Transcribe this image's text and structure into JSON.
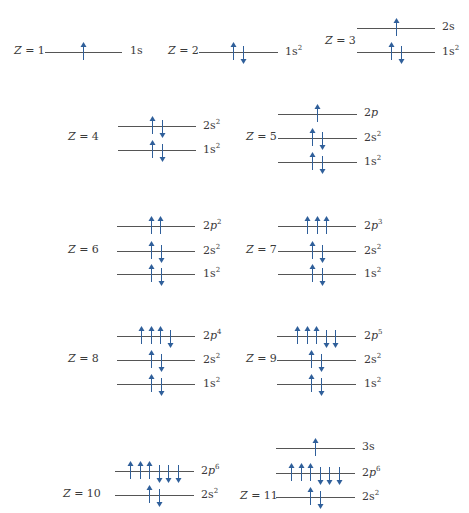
{
  "figure": {
    "colors": {
      "arrow": "#2f5f9a",
      "line": "#555555",
      "text": "#3a3a3a"
    },
    "atoms": [
      {
        "z_label": "Z = 1",
        "levels": [
          {
            "orbital": "1s",
            "num": "1",
            "sub": "s",
            "exp": "",
            "spins": [
              "up"
            ]
          }
        ]
      },
      {
        "z_label": "Z = 2",
        "levels": [
          {
            "orbital": "1s2",
            "num": "1",
            "sub": "s",
            "exp": "2",
            "spins": [
              "up",
              "down"
            ]
          }
        ]
      },
      {
        "z_label": "Z = 3",
        "levels": [
          {
            "orbital": "2s",
            "num": "2",
            "sub": "s",
            "exp": "",
            "spins": [
              "up"
            ]
          },
          {
            "orbital": "1s2",
            "num": "1",
            "sub": "s",
            "exp": "2",
            "spins": [
              "up",
              "down"
            ]
          }
        ]
      },
      {
        "z_label": "Z = 4",
        "levels": [
          {
            "orbital": "2s2",
            "num": "2",
            "sub": "s",
            "exp": "2",
            "spins": [
              "up",
              "down"
            ]
          },
          {
            "orbital": "1s2",
            "num": "1",
            "sub": "s",
            "exp": "2",
            "spins": [
              "up",
              "down"
            ]
          }
        ]
      },
      {
        "z_label": "Z = 5",
        "levels": [
          {
            "orbital": "2p",
            "num": "2",
            "sub": "p",
            "exp": "",
            "spins": [
              "up"
            ]
          },
          {
            "orbital": "2s2",
            "num": "2",
            "sub": "s",
            "exp": "2",
            "spins": [
              "up",
              "down"
            ]
          },
          {
            "orbital": "1s2",
            "num": "1",
            "sub": "s",
            "exp": "2",
            "spins": [
              "up",
              "down"
            ]
          }
        ]
      },
      {
        "z_label": "Z = 6",
        "levels": [
          {
            "orbital": "2p2",
            "num": "2",
            "sub": "p",
            "exp": "2",
            "spins": [
              "up",
              "up"
            ]
          },
          {
            "orbital": "2s2",
            "num": "2",
            "sub": "s",
            "exp": "2",
            "spins": [
              "up",
              "down"
            ]
          },
          {
            "orbital": "1s2",
            "num": "1",
            "sub": "s",
            "exp": "2",
            "spins": [
              "up",
              "down"
            ]
          }
        ]
      },
      {
        "z_label": "Z = 7",
        "levels": [
          {
            "orbital": "2p3",
            "num": "2",
            "sub": "p",
            "exp": "3",
            "spins": [
              "up",
              "up",
              "up"
            ]
          },
          {
            "orbital": "2s2",
            "num": "2",
            "sub": "s",
            "exp": "2",
            "spins": [
              "up",
              "down"
            ]
          },
          {
            "orbital": "1s2",
            "num": "1",
            "sub": "s",
            "exp": "2",
            "spins": [
              "up",
              "down"
            ]
          }
        ]
      },
      {
        "z_label": "Z = 8",
        "levels": [
          {
            "orbital": "2p4",
            "num": "2",
            "sub": "p",
            "exp": "4",
            "spins": [
              "up",
              "up",
              "up",
              "down"
            ]
          },
          {
            "orbital": "2s2",
            "num": "2",
            "sub": "s",
            "exp": "2",
            "spins": [
              "up",
              "down"
            ]
          },
          {
            "orbital": "1s2",
            "num": "1",
            "sub": "s",
            "exp": "2",
            "spins": [
              "up",
              "down"
            ]
          }
        ]
      },
      {
        "z_label": "Z = 9",
        "levels": [
          {
            "orbital": "2p5",
            "num": "2",
            "sub": "p",
            "exp": "5",
            "spins": [
              "up",
              "up",
              "up",
              "down",
              "down"
            ]
          },
          {
            "orbital": "2s2",
            "num": "2",
            "sub": "s",
            "exp": "2",
            "spins": [
              "up",
              "down"
            ]
          },
          {
            "orbital": "1s2",
            "num": "1",
            "sub": "s",
            "exp": "2",
            "spins": [
              "up",
              "down"
            ]
          }
        ]
      },
      {
        "z_label": "Z = 10",
        "levels": [
          {
            "orbital": "2p6",
            "num": "2",
            "sub": "p",
            "exp": "6",
            "spins": [
              "up",
              "up",
              "up",
              "down",
              "down",
              "down"
            ]
          },
          {
            "orbital": "2s2",
            "num": "2",
            "sub": "s",
            "exp": "2",
            "spins": [
              "up",
              "down"
            ]
          }
        ]
      },
      {
        "z_label": "Z = 11",
        "levels": [
          {
            "orbital": "3s",
            "num": "3",
            "sub": "s",
            "exp": "",
            "spins": [
              "up"
            ]
          },
          {
            "orbital": "2p6",
            "num": "2",
            "sub": "p",
            "exp": "6",
            "spins": [
              "up",
              "up",
              "up",
              "down",
              "down",
              "down"
            ]
          },
          {
            "orbital": "2s2",
            "num": "2",
            "sub": "s",
            "exp": "2",
            "spins": [
              "up",
              "down"
            ]
          }
        ]
      }
    ]
  }
}
